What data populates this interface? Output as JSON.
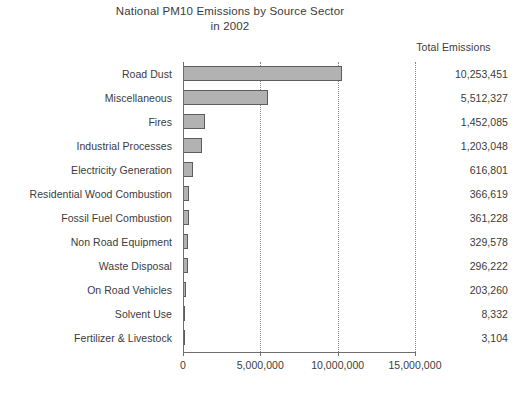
{
  "chart_data": {
    "type": "bar",
    "orientation": "horizontal",
    "title": "National PM10 Emissions by Source Sector",
    "subtitle": "in 2002",
    "value_column_header": "Total Emissions",
    "xlabel": "",
    "ylabel": "",
    "xlim": [
      0,
      15000000
    ],
    "grid": true,
    "legend": false,
    "bar_color": "#b2b2b2",
    "bar_border_color": "#5d5d5d",
    "xticks": [
      0,
      5000000,
      10000000,
      15000000
    ],
    "xticklabels": [
      "0",
      "5,000,000",
      "10,000,000",
      "15,000,000"
    ],
    "categories": [
      "Road Dust",
      "Miscellaneous",
      "Fires",
      "Industrial Processes",
      "Electricity Generation",
      "Residential Wood Combustion",
      "Fossil Fuel Combustion",
      "Non Road Equipment",
      "Waste Disposal",
      "On Road Vehicles",
      "Solvent Use",
      "Fertilizer & Livestock"
    ],
    "values": [
      10253451,
      5512327,
      1452085,
      1203048,
      616801,
      366619,
      361228,
      329578,
      296222,
      203260,
      8332,
      3104
    ],
    "value_labels": [
      "10,253,451",
      "5,512,327",
      "1,452,085",
      "1,203,048",
      "616,801",
      "366,619",
      "361,228",
      "329,578",
      "296,222",
      "203,260",
      "8,332",
      "3,104"
    ]
  }
}
